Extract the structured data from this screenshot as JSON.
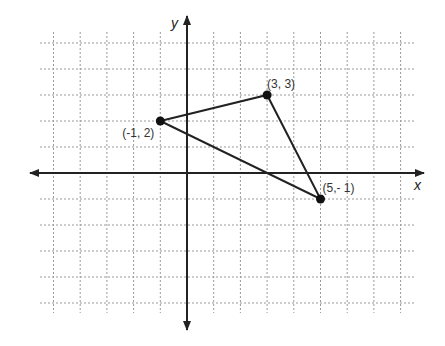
{
  "diagram": {
    "type": "coordinate-plane",
    "axes": {
      "x_label": "x",
      "y_label": "y"
    },
    "grid": {
      "x_range": [
        -5,
        8
      ],
      "y_range": [
        -5,
        5
      ],
      "style": "dotted"
    },
    "points": [
      {
        "label": "(-1, 2)",
        "x": -1,
        "y": 2
      },
      {
        "label": "(3, 3)",
        "x": 3,
        "y": 3
      },
      {
        "label": "(5,- 1)",
        "x": 5,
        "y": -1
      }
    ],
    "shape": "triangle",
    "colors": {
      "grid": "#999999",
      "axis": "#222222",
      "line": "#222222",
      "point": "#111111"
    }
  }
}
